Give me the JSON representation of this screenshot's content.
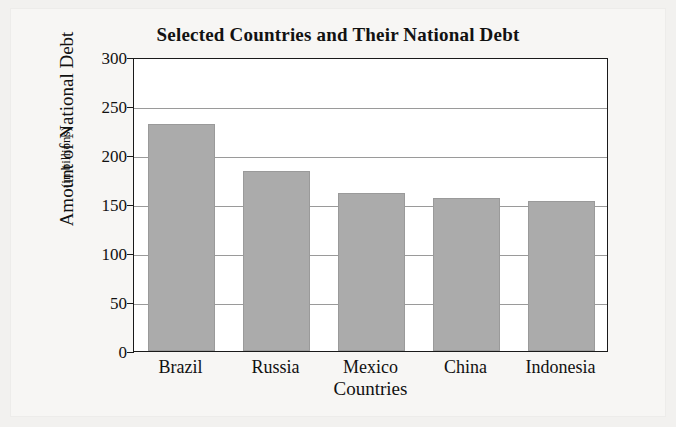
{
  "chart_data": {
    "type": "bar",
    "title": "Selected Countries and Their National Debt",
    "xlabel": "Countries",
    "ylabel": "Amount of National Debt",
    "ylabel_sub": "(in billions)",
    "categories": [
      "Brazil",
      "Russia",
      "Mexico",
      "China",
      "Indonesia"
    ],
    "values": [
      232,
      184,
      161,
      156,
      153
    ],
    "yticks": [
      0,
      50,
      100,
      150,
      200,
      250,
      300
    ],
    "ylim": [
      0,
      300
    ],
    "grid": "horizontal",
    "legend": "none",
    "series": [
      {
        "name": "National Debt",
        "values": [
          232,
          184,
          161,
          156,
          153
        ]
      }
    ],
    "colors": {
      "bar_fill": "#ababab",
      "bar_edge": "#9a9a9a",
      "gridline": "#9a9a9a",
      "axis": "#1a1a1a",
      "plot_background": "#ffffff",
      "page_background": "#f2f1ef",
      "text": "#111111"
    }
  }
}
